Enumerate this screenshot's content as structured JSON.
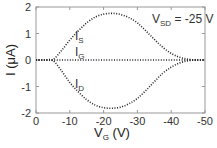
{
  "chart_data": {
    "type": "line",
    "title": "",
    "xlabel": "V_G (V)",
    "ylabel": "I (μA)",
    "xlim": [
      0,
      -50
    ],
    "ylim": [
      -2,
      2
    ],
    "x_ticks": [
      0,
      -10,
      -20,
      -30,
      -40,
      -50
    ],
    "x_tick_labels": [
      "0",
      "-10",
      "-20",
      "-30",
      "-40",
      "-50"
    ],
    "y_ticks": [
      2,
      1,
      0,
      -1,
      -2
    ],
    "y_tick_labels": [
      "2",
      "1",
      "0",
      "-1",
      "-2"
    ],
    "grid": false,
    "legend": "none (inline curve labels)",
    "annotation": "V_SD = -25 V",
    "x": [
      0,
      -2.5,
      -5,
      -7.5,
      -10,
      -12.5,
      -15,
      -17.5,
      -20,
      -22.5,
      -25,
      -27.5,
      -30,
      -32.5,
      -35,
      -37.5,
      -40,
      -42.5,
      -45,
      -47.5,
      -50
    ],
    "series": [
      {
        "name": "I_S",
        "style": "dotted",
        "values": [
          0,
          0,
          0.02,
          0.35,
          0.75,
          1.1,
          1.4,
          1.62,
          1.73,
          1.76,
          1.72,
          1.6,
          1.4,
          1.1,
          0.78,
          0.48,
          0.25,
          0.1,
          0.03,
          0,
          0
        ]
      },
      {
        "name": "I_G",
        "style": "dotted",
        "values": [
          0,
          0,
          0,
          0,
          0,
          0,
          0,
          0,
          0,
          0,
          0,
          0,
          0,
          0,
          0,
          0,
          0,
          0,
          0,
          0,
          0
        ]
      },
      {
        "name": "I_D",
        "style": "dotted",
        "values": [
          0,
          0,
          -0.02,
          -0.4,
          -0.85,
          -1.2,
          -1.5,
          -1.7,
          -1.8,
          -1.82,
          -1.78,
          -1.65,
          -1.45,
          -1.15,
          -0.82,
          -0.5,
          -0.27,
          -0.11,
          -0.03,
          0,
          0
        ]
      }
    ]
  },
  "labels": {
    "ylabel_main": "I (μA)",
    "xlabel_main": "V",
    "xlabel_sub": "G",
    "xlabel_unit": " (V)",
    "annot_main": "V",
    "annot_sub": "SD",
    "annot_rest": " = -25 V",
    "is_main": "I",
    "is_sub": "S",
    "ig_main": "I",
    "ig_sub": "G",
    "id_main": "I",
    "id_sub": "D"
  },
  "colors": {
    "axis": "#888888",
    "curve": "#222222",
    "text": "#333333"
  }
}
